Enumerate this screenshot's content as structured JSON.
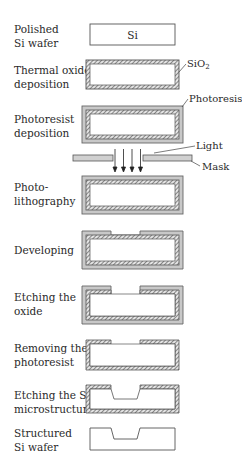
{
  "diagram": {
    "type": "process-flow",
    "colors": {
      "outline": "#555555",
      "oxide_hatch": "#6a6a6a",
      "photoresist": "#c8c8c8",
      "silicon": "#ffffff",
      "mask": "#d0d0d0"
    },
    "steps": [
      {
        "id": "polished",
        "label_line1": "Polished",
        "label_line2": "Si wafer"
      },
      {
        "id": "oxide",
        "label_line1": "Thermal oxide",
        "label_line2": "deposition"
      },
      {
        "id": "resist",
        "label_line1": "Photoresist",
        "label_line2": "deposition"
      },
      {
        "id": "litho",
        "label_line1": "Photo-",
        "label_line2": "lithography"
      },
      {
        "id": "develop",
        "label_line1": "Developing",
        "label_line2": ""
      },
      {
        "id": "etch_oxide",
        "label_line1": "Etching the",
        "label_line2": "oxide"
      },
      {
        "id": "remove_resist",
        "label_line1": "Removing the",
        "label_line2": "photoresist"
      },
      {
        "id": "etch_si",
        "label_line1": "Etching the Si",
        "label_line2": "microstructure"
      },
      {
        "id": "structured",
        "label_line1": "Structured",
        "label_line2": "Si wafer"
      }
    ],
    "annotations": {
      "si": "Si",
      "sio2_base": "SiO",
      "sio2_sub": "2",
      "photoresist": "Photoresist",
      "light": "Light",
      "mask": "Mask"
    }
  }
}
